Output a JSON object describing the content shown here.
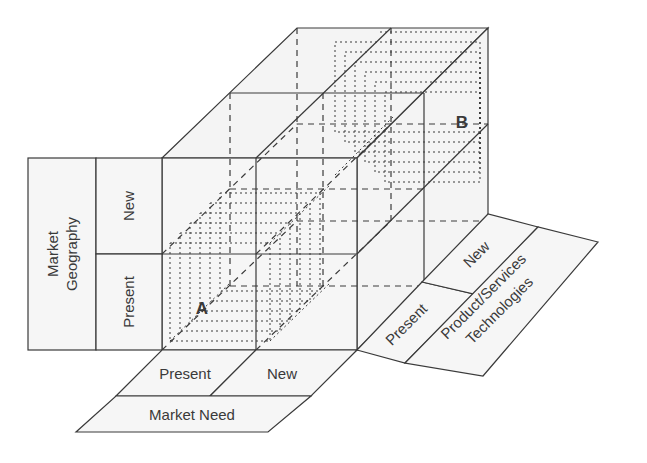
{
  "diagram": {
    "type": "3d-matrix-cube",
    "axes": {
      "vertical": {
        "title_line1": "Market",
        "title_line2": "Geography",
        "levels": [
          "Present",
          "New"
        ]
      },
      "horizontal": {
        "title": "Market Need",
        "levels": [
          "Present",
          "New"
        ]
      },
      "depth": {
        "title_line1": "Product/Services",
        "title_line2": "Technologies",
        "levels": [
          "Present",
          "New"
        ]
      }
    },
    "points": {
      "a": "A",
      "b": "B"
    },
    "colors": {
      "line": "#3a3a3a",
      "face_fill": "#f4f4f4",
      "background": "#ffffff"
    }
  }
}
